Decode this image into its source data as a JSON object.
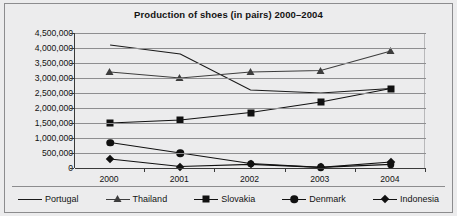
{
  "chart_data": {
    "type": "line",
    "title": "Production of shoes (in pairs) 2000–2004",
    "xlabel": "",
    "ylabel": "",
    "categories": [
      "2000",
      "2001",
      "2002",
      "2003",
      "2004"
    ],
    "ylim": [
      0,
      4500000
    ],
    "ytick_labels": [
      "4,500,000",
      "4,000,000",
      "3,500,000",
      "3,000,000",
      "2,500,000",
      "2,000,000",
      "1,500,000",
      "1,000,000",
      "500,000",
      "0"
    ],
    "ytick_values": [
      4500000,
      4000000,
      3500000,
      3000000,
      2500000,
      2000000,
      1500000,
      1000000,
      500000,
      0
    ],
    "grid": true,
    "legend_position": "bottom",
    "series": [
      {
        "name": "Portugal",
        "marker": "none",
        "color": "#1a1a1a",
        "values": [
          4100000,
          3800000,
          2600000,
          2500000,
          2650000
        ]
      },
      {
        "name": "Thailand",
        "marker": "triangle",
        "color": "#3d3d3d",
        "values": [
          3200000,
          3000000,
          3200000,
          3250000,
          3900000
        ]
      },
      {
        "name": "Slovakia",
        "marker": "square",
        "color": "#111111",
        "values": [
          1500000,
          1600000,
          1850000,
          2200000,
          2650000
        ]
      },
      {
        "name": "Denmark",
        "marker": "circle",
        "color": "#111111",
        "values": [
          850000,
          500000,
          150000,
          20000,
          120000
        ]
      },
      {
        "name": "Indonesia",
        "marker": "diamond",
        "color": "#111111",
        "values": [
          300000,
          50000,
          120000,
          20000,
          200000
        ]
      }
    ]
  }
}
